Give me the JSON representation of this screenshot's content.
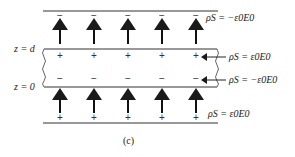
{
  "figure": {
    "caption": "(c)",
    "labels": {
      "z_top": "z = d",
      "z_bottom": "z = 0",
      "rho_top_plate": "ρS = −ε0E0",
      "rho_slab_top": "ρS = ε0E0",
      "rho_slab_bottom": "ρS = −ε0E0",
      "rho_bottom_plate": "ρS = ε0E0"
    },
    "charges": {
      "top_plate": [
        "−",
        "−",
        "−",
        "−",
        "−"
      ],
      "slab_top": [
        "+",
        "+",
        "+",
        "+",
        "+"
      ],
      "slab_bottom": [
        "−",
        "−",
        "−",
        "−",
        "−"
      ],
      "bottom_plate": [
        "+",
        "+",
        "+",
        "+",
        "+"
      ]
    },
    "field_direction": "upward",
    "colors": {
      "line": "#1a1a1a",
      "text": "#1a1a1a"
    }
  }
}
